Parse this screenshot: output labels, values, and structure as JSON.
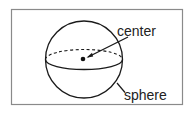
{
  "figure": {
    "subject": "sphere",
    "labels": {
      "center": "center",
      "sphere": "sphere"
    },
    "colors": {
      "frame": "#8a8a8a",
      "stroke": "#1a1a1a",
      "background": "#ffffff"
    }
  }
}
